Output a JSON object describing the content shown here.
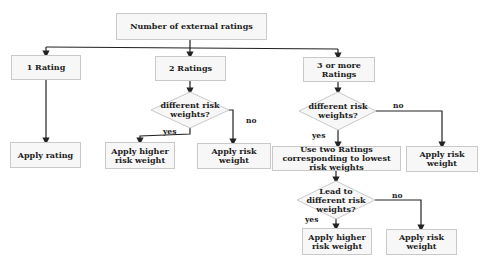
{
  "diagram": {
    "root": {
      "label": "Number of external ratings"
    },
    "branches": [
      {
        "label": "1 Rating",
        "result": "Apply rating"
      },
      {
        "label": "2 Ratings",
        "decision": "different risk weights?",
        "yes": "Apply higher risk weight",
        "no": "Apply risk weight"
      },
      {
        "label": "3 or more Ratings",
        "decision": "different risk weights?",
        "yes": "Use two Ratings corresponding to lowest risk weights",
        "no": "Apply risk weight",
        "sub_decision": "Lead to different risk weights?",
        "sub_yes": "Apply higher risk weight",
        "sub_no": "Apply risk weight"
      }
    ],
    "edge_labels": {
      "yes": "yes",
      "no": "no"
    },
    "colors": {
      "box_fill": "#f7f7f7",
      "box_border": "#c9c9c9",
      "line": "#222222"
    }
  }
}
